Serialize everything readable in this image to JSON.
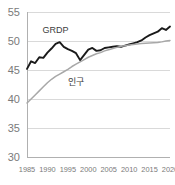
{
  "chart_data": {
    "type": "line",
    "title": "",
    "subtitle": "",
    "xlabel": "",
    "ylabel": "",
    "xlim": [
      1985,
      2020
    ],
    "ylim": [
      30,
      55
    ],
    "grid": true,
    "legend_position": "inline-annotation",
    "xticks": [
      "1985",
      "1990",
      "1995",
      "2000",
      "2005",
      "2010",
      "2015",
      "2020"
    ],
    "yticks": [
      "30",
      "35",
      "40",
      "45",
      "50",
      "55"
    ],
    "x": [
      1985,
      1986,
      1987,
      1988,
      1989,
      1990,
      1991,
      1992,
      1993,
      1994,
      1995,
      1996,
      1997,
      1998,
      1999,
      2000,
      2001,
      2002,
      2003,
      2004,
      2005,
      2006,
      2007,
      2008,
      2009,
      2010,
      2011,
      2012,
      2013,
      2014,
      2015,
      2016,
      2017,
      2018,
      2019,
      2020
    ],
    "series": [
      {
        "name": "GRDP",
        "color": "#1a1a1a",
        "label_x": 1992,
        "label_y": 51.3,
        "values": [
          45.2,
          46.5,
          46.2,
          47.2,
          47.1,
          48.0,
          48.7,
          49.5,
          49.8,
          49.0,
          48.6,
          48.3,
          47.9,
          46.7,
          47.6,
          48.5,
          48.8,
          48.3,
          48.4,
          48.8,
          48.9,
          49.0,
          49.1,
          49.0,
          49.2,
          49.4,
          49.6,
          49.8,
          50.1,
          50.6,
          51.0,
          51.3,
          51.6,
          52.2,
          51.9,
          52.5
        ]
      },
      {
        "name": "인구",
        "color": "#a8a8a8",
        "label_x": 1997,
        "label_y": 42.4,
        "values": [
          39.3,
          40.0,
          40.7,
          41.4,
          42.1,
          42.8,
          43.4,
          43.9,
          44.3,
          44.7,
          45.1,
          45.6,
          46.0,
          46.4,
          46.8,
          47.2,
          47.5,
          47.8,
          48.0,
          48.3,
          48.5,
          48.7,
          48.9,
          49.1,
          49.2,
          49.3,
          49.4,
          49.5,
          49.55,
          49.6,
          49.65,
          49.7,
          49.75,
          49.85,
          50.0,
          50.1
        ]
      }
    ]
  }
}
